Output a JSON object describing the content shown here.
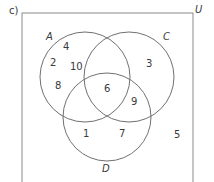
{
  "part_label": "c)",
  "universal_set_label": "U",
  "sets": [
    {
      "name": "A",
      "cx": 85,
      "cy": 77,
      "r": 45
    },
    {
      "name": "C",
      "cx": 129,
      "cy": 77,
      "r": 45
    },
    {
      "name": "D",
      "cx": 107,
      "cy": 117,
      "r": 44
    }
  ],
  "regions": {
    "a_only_top": "4",
    "a_only_left": "2",
    "a_only_mid": "10",
    "a_only_bottom": "8",
    "c_only": "3",
    "a_c_d": "6",
    "c_d_only": "9",
    "d_only_left": "1",
    "d_only_right": "7",
    "outside": "5"
  },
  "colors": {
    "stroke": "#707070",
    "text": "#3a3a3a"
  }
}
